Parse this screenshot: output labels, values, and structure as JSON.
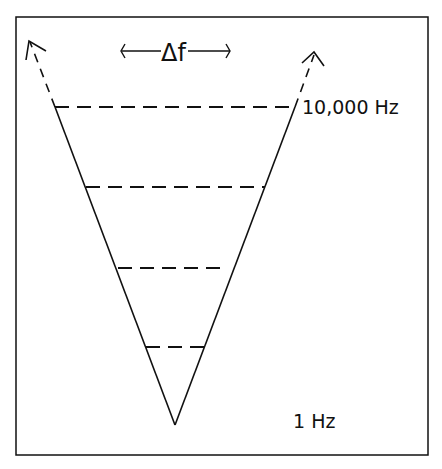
{
  "diagram": {
    "title_label": "‹——Δf——›",
    "delta_f": "Δf",
    "top_label": "10,000 Hz",
    "bottom_label": "1 Hz",
    "levels": [
      {
        "y": 107,
        "x1": 55,
        "x2": 295
      },
      {
        "y": 187,
        "x1": 85,
        "x2": 265
      },
      {
        "y": 268,
        "x1": 118,
        "x2": 225
      },
      {
        "y": 347,
        "x1": 146,
        "x2": 207
      }
    ],
    "colors": {
      "stroke": "#111111",
      "background": "#ffffff"
    }
  }
}
